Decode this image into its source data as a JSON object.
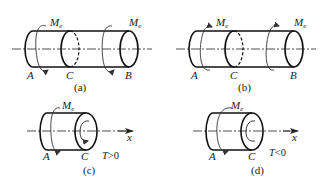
{
  "figures": [
    {
      "id": "a",
      "caption": "(a)",
      "points": [
        "A",
        "C",
        "B"
      ],
      "moments": [
        {
          "symbol": "M",
          "subscript": "e",
          "position": "near-A"
        },
        {
          "symbol": "M",
          "subscript": "e",
          "position": "near-B"
        }
      ]
    },
    {
      "id": "b",
      "caption": "(b)",
      "points": [
        "A",
        "C",
        "B"
      ],
      "moments": [
        {
          "symbol": "M",
          "subscript": "e",
          "position": "near-A"
        },
        {
          "symbol": "M",
          "subscript": "e",
          "position": "near-B"
        }
      ]
    },
    {
      "id": "c",
      "caption": "(c)",
      "points": [
        "A",
        "C"
      ],
      "moments": [
        {
          "symbol": "M",
          "subscript": "e",
          "position": "near-A"
        }
      ],
      "axis_label": "x",
      "condition": {
        "symbol": "T",
        "relation": ">0"
      }
    },
    {
      "id": "d",
      "caption": "(d)",
      "points": [
        "A",
        "C"
      ],
      "moments": [
        {
          "symbol": "M",
          "subscript": "e",
          "position": "near-A"
        }
      ],
      "axis_label": "x",
      "condition": {
        "symbol": "T",
        "relation": "<0"
      }
    }
  ]
}
